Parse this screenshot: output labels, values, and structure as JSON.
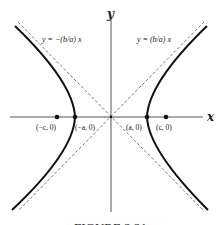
{
  "diagram": {
    "type": "hyperbola",
    "axes": {
      "x_label": "x",
      "y_label": "y"
    },
    "asymptotes": [
      {
        "label": "y = −(b/a) x",
        "slope": "-b/a",
        "style": "dashed"
      },
      {
        "label": "y = (b/a) x",
        "slope": "b/a",
        "style": "dashed"
      }
    ],
    "points": [
      {
        "label": "(−c, 0)",
        "role": "focus"
      },
      {
        "label": "(−a, 0)",
        "role": "vertex"
      },
      {
        "label": "(a, 0)",
        "role": "vertex"
      },
      {
        "label": "(c, 0)",
        "role": "focus"
      }
    ],
    "caption": "FIGURE 2.21",
    "colors": {
      "curve": "#111111",
      "axis": "#444444",
      "asymptote": "#555555",
      "background": "#ffffff"
    }
  }
}
